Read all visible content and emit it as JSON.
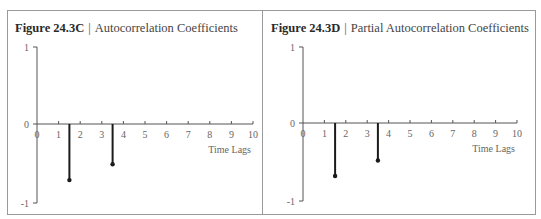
{
  "chart_data": [
    {
      "type": "bar",
      "subtype": "stem",
      "figure_label": "Figure 24.3C",
      "title": "Autocorrelation Coefficients",
      "xlabel": "Time Lags",
      "ylabel": "",
      "x_ticks": [
        0,
        1,
        2,
        3,
        4,
        5,
        6,
        7,
        8,
        9,
        10
      ],
      "y_ticks": [
        1,
        0,
        -1
      ],
      "xlim": [
        0,
        10
      ],
      "ylim": [
        -1,
        1
      ],
      "grid": false,
      "series": [
        {
          "name": "Autocorrelation",
          "x": [
            1.5,
            3.5
          ],
          "values": [
            -0.71,
            -0.51
          ]
        }
      ]
    },
    {
      "type": "bar",
      "subtype": "stem",
      "figure_label": "Figure 24.3D",
      "title": "Partial Autocorrelation Coefficients",
      "xlabel": "Time Lags",
      "ylabel": "",
      "x_ticks": [
        0,
        1,
        2,
        3,
        4,
        5,
        6,
        7,
        8,
        9,
        10
      ],
      "y_ticks": [
        1,
        0,
        -1
      ],
      "xlim": [
        0,
        10
      ],
      "ylim": [
        -1,
        1
      ],
      "grid": false,
      "series": [
        {
          "name": "Partial Autocorrelation",
          "x": [
            1.5,
            3.5
          ],
          "values": [
            -0.68,
            -0.48
          ]
        }
      ]
    }
  ],
  "panels": [
    {
      "figure_label": "Figure 24.3C",
      "separator": "|",
      "title": "Autocorrelation Coefficients",
      "xlabel": "Time Lags"
    },
    {
      "figure_label": "Figure 24.3D",
      "separator": "|",
      "title": "Partial Autocorrelation Coefficients",
      "xlabel": "Time Lags"
    }
  ],
  "colors": {
    "frame": "#9a9a9a",
    "axis": "#555555",
    "stem": "#1a1a1a",
    "text": "#444444"
  }
}
